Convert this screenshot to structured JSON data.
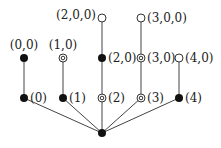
{
  "diagram": {
    "type": "tree",
    "root": {
      "id": "root",
      "x": 102,
      "y": 133,
      "marker": "filled",
      "label": ""
    },
    "nodes": [
      {
        "id": "n0",
        "x": 24,
        "y": 98,
        "marker": "filled",
        "label": "(0)",
        "label_side": "right"
      },
      {
        "id": "n1",
        "x": 63,
        "y": 98,
        "marker": "filled",
        "label": "(1)",
        "label_side": "right"
      },
      {
        "id": "n2",
        "x": 102,
        "y": 98,
        "marker": "double",
        "label": "(2)",
        "label_side": "right"
      },
      {
        "id": "n3",
        "x": 141,
        "y": 98,
        "marker": "double",
        "label": "(3)",
        "label_side": "right"
      },
      {
        "id": "n4",
        "x": 179,
        "y": 98,
        "marker": "filled",
        "label": "(4)",
        "label_side": "right"
      },
      {
        "id": "n00",
        "x": 24,
        "y": 58,
        "marker": "filled",
        "label": "(0,0)",
        "label_side": "top"
      },
      {
        "id": "n10",
        "x": 63,
        "y": 58,
        "marker": "double",
        "label": "(1,0)",
        "label_side": "top"
      },
      {
        "id": "n20",
        "x": 102,
        "y": 58,
        "marker": "filled",
        "label": "(2,0)",
        "label_side": "right"
      },
      {
        "id": "n30",
        "x": 141,
        "y": 58,
        "marker": "double",
        "label": "(3,0)",
        "label_side": "right"
      },
      {
        "id": "n40",
        "x": 179,
        "y": 58,
        "marker": "open",
        "label": "(4,0)",
        "label_side": "right"
      },
      {
        "id": "n200",
        "x": 102,
        "y": 18,
        "marker": "open",
        "label": "(2,0,0)",
        "label_side": "left"
      },
      {
        "id": "n300",
        "x": 141,
        "y": 18,
        "marker": "open",
        "label": "(3,0,0)",
        "label_side": "right"
      }
    ],
    "edges": [
      [
        "root",
        "n0"
      ],
      [
        "root",
        "n1"
      ],
      [
        "root",
        "n2"
      ],
      [
        "root",
        "n3"
      ],
      [
        "root",
        "n4"
      ],
      [
        "n0",
        "n00"
      ],
      [
        "n1",
        "n10"
      ],
      [
        "n2",
        "n20"
      ],
      [
        "n3",
        "n30"
      ],
      [
        "n4",
        "n40"
      ],
      [
        "n20",
        "n200"
      ],
      [
        "n30",
        "n300"
      ]
    ],
    "legend_markers": {
      "filled": "filled black dot",
      "double": "double concentric circle",
      "open": "open circle"
    }
  }
}
